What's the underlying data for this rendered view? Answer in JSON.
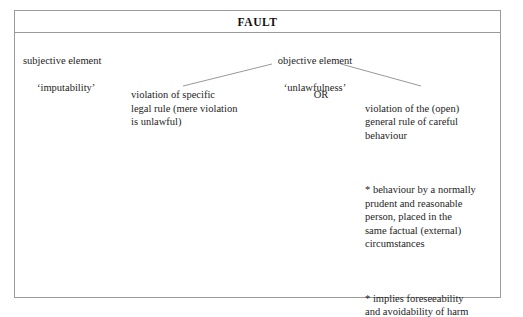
{
  "diagram": {
    "header": {
      "title": "FAULT"
    },
    "top_row": {
      "subjective": {
        "line1": "subjective element",
        "line2": "‘imputability’"
      },
      "objective": {
        "line1": "objective element",
        "line2": "‘unlawfulness’"
      }
    },
    "branches": {
      "left": {
        "text": "violation of specific\nlegal rule (mere violation\nis unlawful)"
      },
      "connector_label": "OR",
      "right": {
        "heading": "violation of the (open)\ngeneral rule of careful\nbehaviour",
        "bullets": [
          "* behaviour by a normally\nprudent and reasonable\nperson, placed in the\nsame factual (external)\ncircumstances",
          "*  implies foreseeability\nand avoidability of harm"
        ]
      }
    },
    "colors": {
      "border": "#9a9a9a",
      "text": "#1d1d1d",
      "background": "#ffffff",
      "connector_line": "#8c8c8c"
    }
  }
}
